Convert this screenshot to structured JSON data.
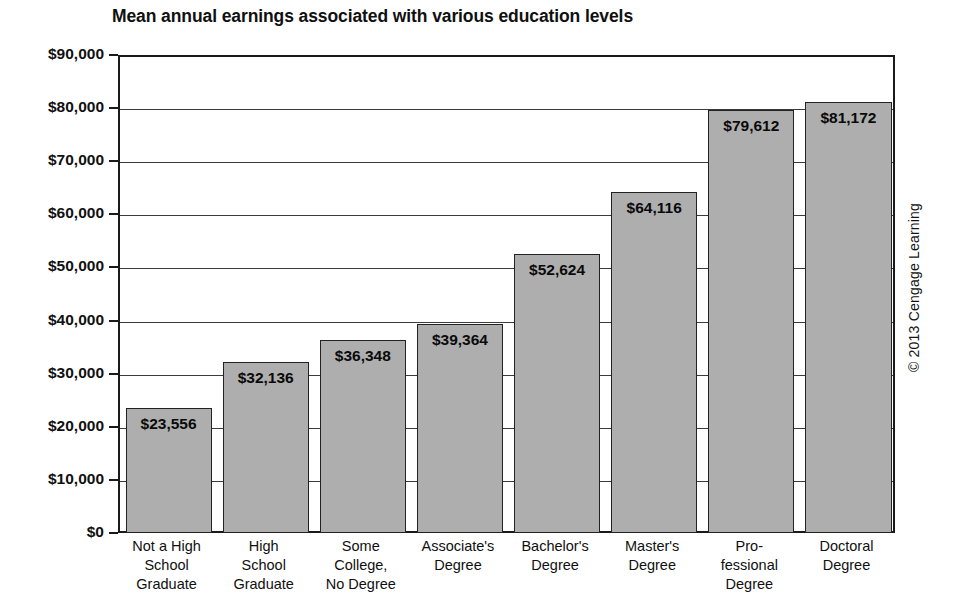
{
  "chart_data": {
    "type": "bar",
    "title": "Mean annual earnings associated with various education levels",
    "xlabel": "",
    "ylabel": "",
    "ylim": [
      0,
      90000
    ],
    "ytick_step": 10000,
    "grid": true,
    "legend": false,
    "categories": [
      "Not a High School Graduate",
      "High School Graduate",
      "Some College, No Degree",
      "Associate's Degree",
      "Bachelor's Degree",
      "Master's Degree",
      "Professional Degree",
      "Doctoral Degree"
    ],
    "category_lines": [
      [
        "Not a High",
        "School",
        "Graduate"
      ],
      [
        "High",
        "School",
        "Graduate"
      ],
      [
        "Some",
        "College,",
        "No Degree"
      ],
      [
        "Associate's",
        "Degree"
      ],
      [
        "Bachelor's",
        "Degree"
      ],
      [
        "Master's",
        "Degree"
      ],
      [
        "Pro-",
        "fessional",
        "Degree"
      ],
      [
        "Doctoral",
        "Degree"
      ]
    ],
    "values": [
      23556,
      32136,
      36348,
      39364,
      52624,
      64116,
      79612,
      81172
    ],
    "value_labels": [
      "$23,556",
      "$32,136",
      "$36,348",
      "$39,364",
      "$52,624",
      "$64,116",
      "$79,612",
      "$81,172"
    ],
    "ytick_labels": [
      "$90,000",
      "$80,000",
      "$70,000",
      "$60,000",
      "$50,000",
      "$40,000",
      "$30,000",
      "$20,000",
      "$10,000",
      "$0"
    ],
    "ytick_values": [
      90000,
      80000,
      70000,
      60000,
      50000,
      40000,
      30000,
      20000,
      10000,
      0
    ]
  },
  "credit": {
    "text": "© 2013 Cengage Learning"
  },
  "colors": {
    "bar_fill": "#aeaeae",
    "bar_stroke": "#222222",
    "axis": "#1a1a1a",
    "grid": "#3a3a3a",
    "text": "#101010",
    "background": "#ffffff"
  }
}
